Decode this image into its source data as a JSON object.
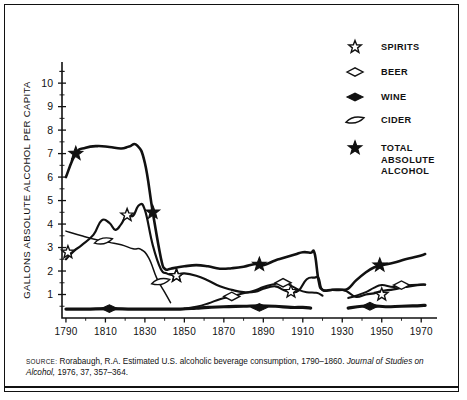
{
  "axes": {
    "ylabel": "GALLONS ABSOLUTE ALCOHOL PER CAPITA",
    "yticks": [
      "1",
      "2",
      "3",
      "4",
      "5",
      "6",
      "7",
      "8",
      "9",
      "10"
    ],
    "xticks": [
      "1790",
      "1810",
      "1830",
      "1850",
      "1870",
      "1890",
      "1910",
      "1930",
      "1950",
      "1970"
    ]
  },
  "legend": {
    "items": [
      {
        "key": "spirits",
        "label": "SPIRITS",
        "marker": "open-star"
      },
      {
        "key": "beer",
        "label": "BEER",
        "marker": "open-diamond"
      },
      {
        "key": "wine",
        "label": "WINE",
        "marker": "filled-diamond"
      },
      {
        "key": "cider",
        "label": "CIDER",
        "marker": "open-lens"
      },
      {
        "key": "total",
        "label": "TOTAL ABSOLUTE ALCOHOL",
        "label_lines": [
          "TOTAL",
          "ABSOLUTE",
          "ALCOHOL"
        ],
        "marker": "filled-star"
      }
    ]
  },
  "source": {
    "prefix": "SOURCE:",
    "text_1": " Rorabaugh, R.A. Estimated U.S. alcoholic beverage consumption, 1790–1860. ",
    "italic_1": "Journal of Studies",
    "italic_2": "on Alcohol,",
    "text_2": "  1976, 37, 357–364."
  },
  "chart_data": {
    "type": "line",
    "title": "",
    "xlabel": "",
    "ylabel": "GALLONS ABSOLUTE ALCOHOL PER CAPITA",
    "xlim": [
      1788,
      1978
    ],
    "ylim": [
      0,
      10.9
    ],
    "grid": false,
    "legend_position": "top-right",
    "series": [
      {
        "name": "TOTAL ABSOLUTE ALCOHOL",
        "marker": "filled-star",
        "x": [
          1790,
          1795,
          1800,
          1806,
          1812,
          1818,
          1822,
          1826,
          1830,
          1834,
          1838,
          1840,
          1843,
          1846,
          1850,
          1856,
          1862,
          1868,
          1874,
          1880,
          1886,
          1890,
          1896,
          1900,
          1906,
          1910,
          1914,
          1916,
          1918,
          1920,
          1925,
          1930,
          1933,
          1937,
          1942,
          1946,
          1950,
          1956,
          1962,
          1968,
          1972
        ],
        "y": [
          6.0,
          7.0,
          7.25,
          7.32,
          7.28,
          7.22,
          7.3,
          7.35,
          6.6,
          4.5,
          2.6,
          2.1,
          2.1,
          2.15,
          2.2,
          2.25,
          2.2,
          2.1,
          2.12,
          2.18,
          2.3,
          2.25,
          2.45,
          2.55,
          2.7,
          2.8,
          2.78,
          2.75,
          1.6,
          1.2,
          1.2,
          1.2,
          1.25,
          1.6,
          1.95,
          2.15,
          2.25,
          2.35,
          2.5,
          2.62,
          2.72
        ],
        "markers": [
          {
            "x": 1795,
            "y": 7.0
          },
          {
            "x": 1834,
            "y": 4.5
          },
          {
            "x": 1846,
            "y": 1.8
          },
          {
            "x": 1888,
            "y": 2.28
          },
          {
            "x": 1949,
            "y": 2.25
          }
        ]
      },
      {
        "name": "SPIRITS",
        "marker": "open-star",
        "x": [
          1790,
          1794,
          1798,
          1804,
          1808,
          1812,
          1815,
          1818,
          1821,
          1824,
          1827,
          1830,
          1834,
          1838,
          1841,
          1843,
          1846,
          1850,
          1856,
          1862,
          1868,
          1874,
          1880,
          1886,
          1890,
          1896,
          1900,
          1904,
          1908,
          1912,
          1916,
          1918,
          1920,
          1925,
          1930,
          1933,
          1937,
          1942,
          1946,
          1950,
          1956,
          1962,
          1968,
          1972
        ],
        "y": [
          2.5,
          2.85,
          3.1,
          3.55,
          4.15,
          4.05,
          3.75,
          4.0,
          4.4,
          4.35,
          4.8,
          4.6,
          3.1,
          2.1,
          1.9,
          1.85,
          1.85,
          1.9,
          1.8,
          1.6,
          1.35,
          1.2,
          1.1,
          1.12,
          1.25,
          1.35,
          1.2,
          1.1,
          1.18,
          1.65,
          1.72,
          1.7,
          1.2,
          1.2,
          1.2,
          1.1,
          0.9,
          1.0,
          1.05,
          1.15,
          1.22,
          1.32,
          1.4,
          1.42
        ],
        "markers": [
          {
            "x": 1791,
            "y": 2.8
          },
          {
            "x": 1821,
            "y": 4.38
          },
          {
            "x": 1846,
            "y": 1.8
          },
          {
            "x": 1904,
            "y": 1.12
          },
          {
            "x": 1950,
            "y": 1.0
          }
        ]
      },
      {
        "name": "BEER",
        "marker": "open-diamond",
        "x": [
          1850,
          1856,
          1862,
          1868,
          1874,
          1880,
          1886,
          1890,
          1896,
          1900,
          1904,
          1908,
          1912,
          1916,
          1918,
          1920,
          1933,
          1937,
          1942,
          1946,
          1950,
          1956,
          1962,
          1968,
          1972
        ],
        "y": [
          0.4,
          0.48,
          0.62,
          0.8,
          0.92,
          1.05,
          1.18,
          1.32,
          1.45,
          1.52,
          1.38,
          1.2,
          1.1,
          1.08,
          1.05,
          0.95,
          0.85,
          0.95,
          1.1,
          1.28,
          1.4,
          1.32,
          1.38,
          1.42,
          1.42
        ],
        "markers": [
          {
            "x": 1874,
            "y": 0.92
          },
          {
            "x": 1900,
            "y": 1.5
          },
          {
            "x": 1960,
            "y": 1.4
          }
        ]
      },
      {
        "name": "WINE",
        "marker": "filled-diamond",
        "x": [
          1790,
          1800,
          1812,
          1824,
          1836,
          1848,
          1856,
          1862,
          1870,
          1880,
          1888,
          1896,
          1904,
          1910,
          1914,
          1933,
          1940,
          1946,
          1952,
          1960,
          1968,
          1972
        ],
        "y": [
          0.38,
          0.38,
          0.4,
          0.38,
          0.38,
          0.38,
          0.42,
          0.45,
          0.48,
          0.5,
          0.52,
          0.5,
          0.45,
          0.45,
          0.42,
          0.42,
          0.5,
          0.52,
          0.48,
          0.5,
          0.52,
          0.54
        ],
        "markers": [
          {
            "x": 1812,
            "y": 0.4
          },
          {
            "x": 1888,
            "y": 0.45
          },
          {
            "x": 1944,
            "y": 0.5
          }
        ]
      },
      {
        "name": "CIDER",
        "marker": "open-lens",
        "x": [
          1790,
          1798,
          1806,
          1812,
          1818,
          1824,
          1828,
          1832,
          1836,
          1840,
          1843
        ],
        "y": [
          3.7,
          3.5,
          3.32,
          3.22,
          3.12,
          2.95,
          2.92,
          2.55,
          1.7,
          1.1,
          0.65
        ],
        "markers": [
          {
            "x": 1809,
            "y": 3.28
          },
          {
            "x": 1838,
            "y": 1.55
          }
        ]
      }
    ]
  }
}
